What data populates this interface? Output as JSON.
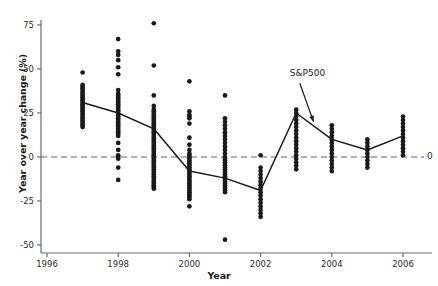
{
  "figure": {
    "name": "sp500-year-over-year-scatter",
    "background": "#ffffff",
    "width": 438,
    "height": 286
  },
  "chart_data": {
    "type": "scatter",
    "title": "",
    "xlabel": "Year",
    "ylabel": "Year over year change (%)",
    "xlim": [
      1995.7,
      2006.9
    ],
    "ylim": [
      -53,
      80
    ],
    "xticks": [
      1996,
      1998,
      2000,
      2002,
      2004,
      2006
    ],
    "xticklabels": [
      "1996",
      "1998",
      "2000",
      "2002",
      "2004",
      "2006"
    ],
    "yticks": [
      -50,
      -25,
      0,
      25,
      50,
      75
    ],
    "yticklabels": [
      "-50",
      "-25",
      "0",
      "25",
      "50",
      "75"
    ],
    "grid": false,
    "legend": "none",
    "colors": {
      "marker": "#1a1a1a",
      "line": "#1a1a1a",
      "zero_line": "#9a9a9a",
      "axis": "#6b6b6b",
      "text": "#1a1a1a"
    },
    "reference_lines": [
      {
        "name": "zero-line",
        "y": 0,
        "style": "dashed",
        "label": "0",
        "label_position": "right"
      }
    ],
    "annotations": [
      {
        "name": "sp500-annotation",
        "text": "S&P500",
        "text_x": 2003.55,
        "text_y": 47,
        "arrow_to_x": 2003.6,
        "arrow_to_y": 20,
        "arrow": true
      }
    ],
    "series": [
      {
        "name": "S&P500",
        "type": "line",
        "x": [
          1997,
          1998,
          1999,
          2000,
          2001,
          2002,
          2003,
          2004,
          2005,
          2006
        ],
        "values": [
          31,
          25,
          16,
          -8,
          -12,
          -19,
          25,
          10,
          4,
          12
        ]
      },
      {
        "name": "individual stocks",
        "type": "scatter",
        "points_by_year": {
          "1997": [
            48,
            41,
            40,
            39,
            38,
            37,
            36,
            35,
            34,
            33,
            32,
            31,
            30,
            29,
            28,
            27,
            26,
            25,
            24,
            23,
            22,
            21,
            20,
            19,
            18,
            17
          ],
          "1998": [
            67,
            60,
            58,
            55,
            51,
            47,
            38,
            36,
            35,
            34,
            33,
            32,
            31,
            30,
            29,
            28,
            27,
            26,
            25,
            24,
            23,
            22,
            21,
            20,
            19,
            18,
            17,
            16,
            15,
            14,
            13,
            12,
            8,
            4,
            1,
            0,
            -1,
            -6,
            -13
          ],
          "1999": [
            76,
            52,
            35,
            29,
            27,
            26,
            25,
            24,
            23,
            22,
            21,
            20,
            19,
            18,
            17,
            16,
            15,
            14,
            13,
            12,
            11,
            10,
            9,
            8,
            7,
            6,
            5,
            4,
            3,
            2,
            1,
            0,
            -1,
            -2,
            -3,
            -4,
            -5,
            -6,
            -7,
            -8,
            -9,
            -10,
            -11,
            -12,
            -13,
            -14,
            -15,
            -16,
            -17,
            -18
          ],
          "2000": [
            43,
            26,
            24,
            23,
            22,
            19,
            11,
            7,
            4,
            2,
            1,
            0,
            -1,
            -2,
            -3,
            -4,
            -5,
            -6,
            -7,
            -8,
            -9,
            -10,
            -11,
            -12,
            -13,
            -14,
            -15,
            -16,
            -17,
            -18,
            -19,
            -20,
            -21,
            -22,
            -23,
            -24,
            -28
          ],
          "2001": [
            35,
            22,
            20,
            18,
            16,
            14,
            12,
            10,
            8,
            6,
            4,
            2,
            0,
            -1,
            -2,
            -3,
            -4,
            -5,
            -6,
            -7,
            -8,
            -9,
            -10,
            -11,
            -12,
            -13,
            -14,
            -15,
            -16,
            -17,
            -18,
            -19,
            -20,
            -47
          ],
          "2002": [
            1,
            -6,
            -8,
            -10,
            -12,
            -14,
            -16,
            -18,
            -20,
            -22,
            -24,
            -26,
            -28,
            -30,
            -32,
            -34
          ],
          "2003": [
            27,
            25,
            23,
            21,
            19,
            17,
            15,
            13,
            11,
            9,
            7,
            5,
            3,
            1,
            -1,
            -3,
            -5,
            -7
          ],
          "2004": [
            18,
            16,
            14,
            12,
            10,
            8,
            6,
            4,
            2,
            0,
            -2,
            -4,
            -6,
            -8
          ],
          "2005": [
            10,
            8,
            6,
            4,
            2,
            0,
            -2,
            -4,
            -6
          ],
          "2006": [
            23,
            21,
            19,
            17,
            15,
            13,
            11,
            9,
            7,
            5,
            3,
            1
          ]
        }
      }
    ]
  },
  "axis": {
    "ylabel_text": "Year over year change (%)",
    "xlabel_text": "Year",
    "zero_label": "0"
  }
}
